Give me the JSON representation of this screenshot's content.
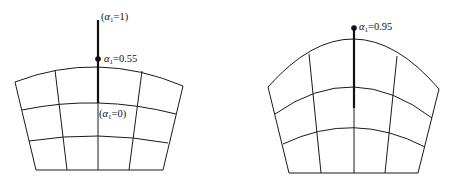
{
  "diagrams": [
    {
      "id": "left",
      "labels": {
        "top": {
          "prefix": "(",
          "symbol": "α",
          "subscript": "1",
          "suffix": "=1)"
        },
        "dot": {
          "prefix": "",
          "symbol": "α",
          "subscript": "1",
          "suffix": "=0.55"
        },
        "bottom": {
          "prefix": "(",
          "symbol": "α",
          "subscript": "1",
          "suffix": "=0)"
        }
      },
      "alpha_current": 0.55
    },
    {
      "id": "right",
      "labels": {
        "dot": {
          "prefix": "",
          "symbol": "α",
          "subscript": "1",
          "suffix": "=0.95"
        }
      },
      "alpha_current": 0.95
    }
  ],
  "colors": {
    "stroke": "#1a1a1a",
    "background": "#ffffff"
  }
}
